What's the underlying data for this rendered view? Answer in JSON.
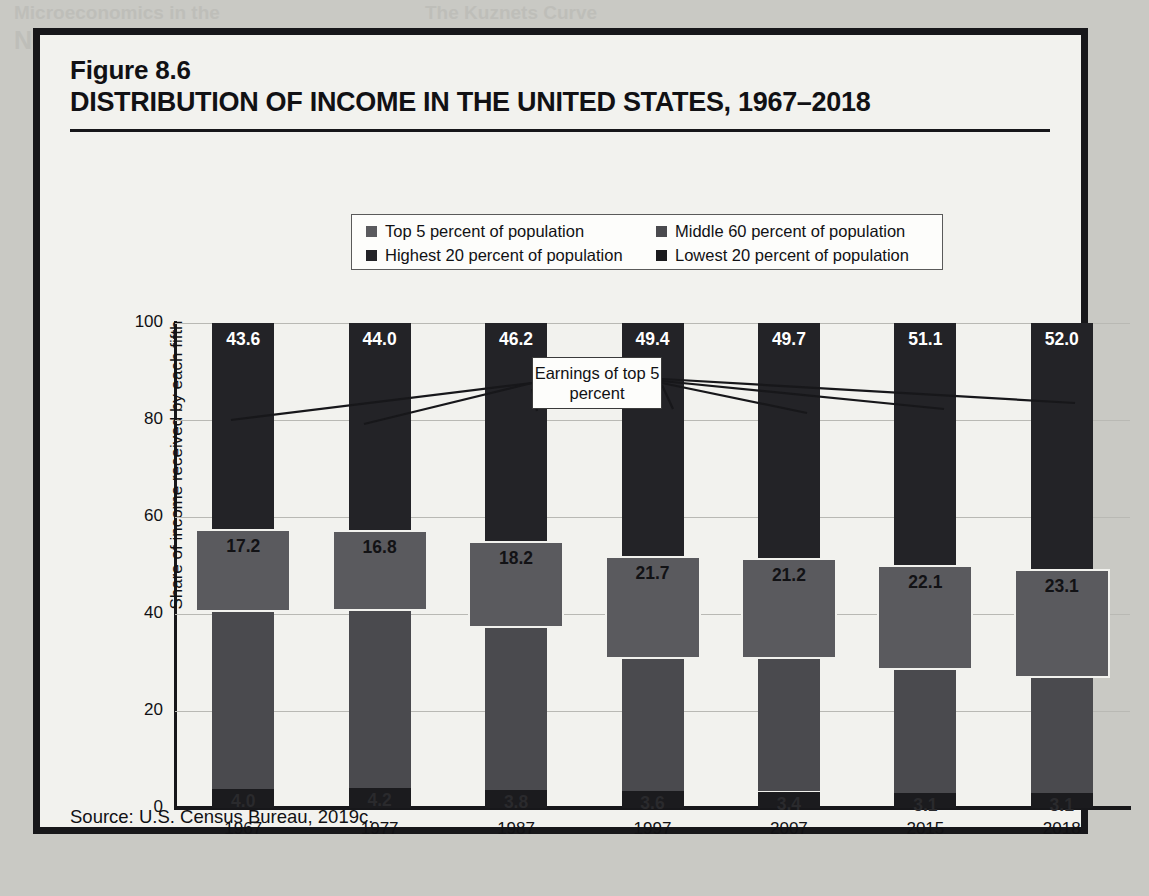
{
  "figure": {
    "label": "Figure 8.6",
    "title": "DISTRIBUTION OF INCOME IN THE UNITED STATES, 1967–2018",
    "source": "Source:  U.S. Census Bureau, 2019c."
  },
  "legend": {
    "items": [
      {
        "label": "Top 5 percent of population",
        "color": "#5a5a5e"
      },
      {
        "label": "Middle 60 percent of population",
        "color": "#4a4a4e"
      },
      {
        "label": "Highest 20 percent of population",
        "color": "#232327"
      },
      {
        "label": "Lowest 20 percent of population",
        "color": "#1b1b1e"
      }
    ]
  },
  "annotation": {
    "callout": "Earnings of top 5 percent"
  },
  "chart_data": {
    "type": "bar",
    "subtype": "stacked-bar-with-overlay",
    "title": "DISTRIBUTION OF INCOME IN THE UNITED STATES, 1967–2018",
    "xlabel": "",
    "ylabel": "Share of income received by each fifth",
    "ylim": [
      0,
      100
    ],
    "yticks": [
      0,
      20,
      40,
      60,
      80,
      100
    ],
    "grid": true,
    "legend_position": "top-center",
    "categories": [
      "1967",
      "1977",
      "1987",
      "1997",
      "2007",
      "2015",
      "2018"
    ],
    "series": [
      {
        "name": "Lowest 20 percent of population",
        "color": "#1b1b1e",
        "values": [
          4.0,
          4.2,
          3.8,
          3.6,
          3.4,
          3.1,
          3.1
        ]
      },
      {
        "name": "Middle 60 percent of population",
        "color": "#4a4a4e",
        "values": [
          52.3,
          51.8,
          50.0,
          47.1,
          46.9,
          45.7,
          45.0
        ]
      },
      {
        "name": "Highest 20 percent of population",
        "color": "#232327",
        "values": [
          43.6,
          44.0,
          46.2,
          49.4,
          49.7,
          51.1,
          52.0
        ]
      },
      {
        "name": "Top 5 percent of population",
        "color": "#5a5a5e",
        "values": [
          17.2,
          16.8,
          18.2,
          21.7,
          21.2,
          22.1,
          23.1
        ]
      }
    ]
  }
}
